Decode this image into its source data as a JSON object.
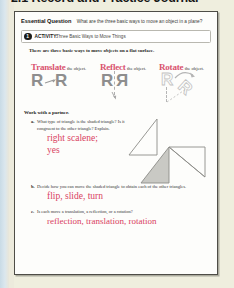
{
  "page": {
    "title": "2.1 Record and Practice Journal",
    "accent_red": "#d9415f",
    "heading_pink": "#d9536f",
    "paper_color": "#fdfdfb",
    "background_color": "#efeede"
  },
  "essential_question": {
    "label": "Essential Question",
    "text": "What are the three basic ways to move an object in a plane?"
  },
  "activity": {
    "number": "1",
    "label": "ACTIVITY:",
    "title": "Three Basic Ways to Move Things"
  },
  "lead_in": "There are three basic ways to move objects on a flat surface.",
  "moves": [
    {
      "name": "Translate",
      "suffix": "the object.",
      "diagram": "two-r-with-arrow"
    },
    {
      "name": "Reflect",
      "suffix": "the object.",
      "diagram": "r-mirrored-over-dashed-line"
    },
    {
      "name": "Rotate",
      "suffix": "the object.",
      "diagram": "r-rotated-with-curved-arrow"
    }
  ],
  "partner_heading": "Work with a partner.",
  "questions": [
    {
      "letter": "a.",
      "text": "What type of triangle is the shaded triangle? Is it congruent to the other triangle? Explain.",
      "answer": "right scalene;\nyes",
      "answer_line1": "right scalene;",
      "answer_line2": "yes"
    },
    {
      "letter": "b.",
      "text": "Decide how you can move the shaded triangle to obtain each of the other triangles.",
      "answer": "flip, slide, turn"
    },
    {
      "letter": "c.",
      "text": "Is each move a translation, a reflection, or a rotation?",
      "answer": "reflection, translation, rotation"
    }
  ],
  "figure": {
    "shaded_fill": "#c9c9c4",
    "outline_color": "#8c8c88"
  }
}
